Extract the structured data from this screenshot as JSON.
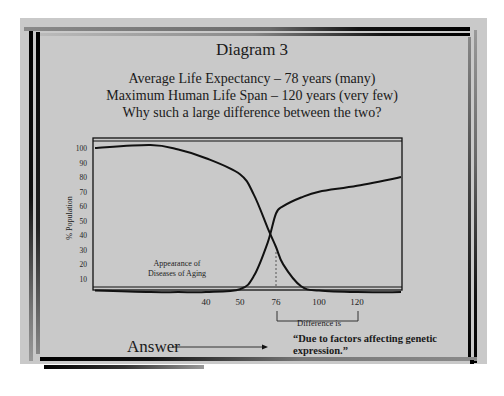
{
  "slide": {
    "title": "Diagram 3",
    "subtitle_lines": [
      "Average Life Expectancy – 78 years (many)",
      "Maximum Human Life Span – 120 years (very few)",
      "Why such a large difference between the two?"
    ],
    "answer_label": "Answer",
    "answer_text_lines": [
      "“Due to factors affecting genetic",
      "expression.”"
    ],
    "difference_label": "Difference is",
    "arrow_icon": "right-arrow"
  },
  "colors": {
    "background": "#c9c9c9",
    "line": "#111111",
    "frame": "#000000"
  },
  "chart_data": {
    "type": "line",
    "title": "",
    "xlabel": "",
    "ylabel": "% Population",
    "y_ticks": [
      10,
      20,
      30,
      40,
      50,
      60,
      70,
      80,
      90,
      100
    ],
    "x_ticks": [
      40,
      50,
      76,
      100,
      120
    ],
    "annotations": [
      {
        "text": "Appearance of",
        "at": "lower-left"
      },
      {
        "text": "Diseases of Aging",
        "at": "lower-left"
      },
      {
        "text": "Difference is",
        "from_x": 76,
        "to_x": 120,
        "position": "below-axis"
      }
    ],
    "reference_line": {
      "x": 76,
      "style": "dashed"
    },
    "series": [
      {
        "name": "Surviving population",
        "x": [
          0,
          20,
          30,
          40,
          50,
          60,
          70,
          76,
          80,
          90,
          100,
          120,
          140
        ],
        "values": [
          100,
          102,
          99,
          93,
          82,
          68,
          45,
          32,
          20,
          5,
          2,
          1,
          1
        ]
      },
      {
        "name": "Appearance of Diseases of Aging",
        "x": [
          0,
          20,
          30,
          40,
          50,
          60,
          70,
          76,
          80,
          90,
          100,
          120,
          140
        ],
        "values": [
          2,
          1,
          1,
          1,
          3,
          12,
          35,
          55,
          60,
          66,
          70,
          74,
          80
        ]
      }
    ],
    "ylim": [
      0,
      105
    ],
    "grid": false,
    "legend": "none"
  }
}
